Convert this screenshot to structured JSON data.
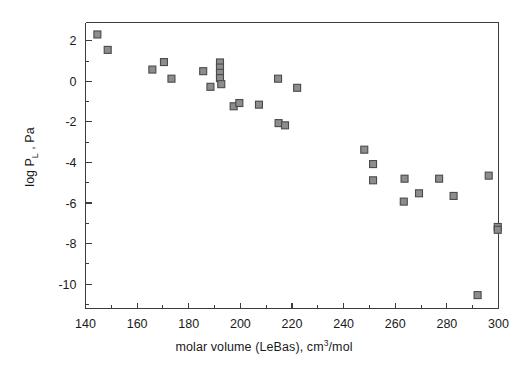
{
  "chart_data": {
    "type": "scatter",
    "title": "",
    "xlabel": "molar volume (LeBas), cm3/mol",
    "xlabel_parts": {
      "pre": "molar volume (LeBas), cm",
      "sup": "3",
      "post": "/mol"
    },
    "ylabel": "log PL , Pa",
    "ylabel_parts": {
      "pre": "log P",
      "sub": "L",
      "post": " , Pa"
    },
    "xlim": [
      140,
      300
    ],
    "ylim": [
      -11.2,
      2.9
    ],
    "xticks": [
      140,
      160,
      180,
      200,
      220,
      240,
      260,
      280,
      300
    ],
    "xticklabels": [
      "140",
      "160",
      "180",
      "200",
      "220",
      "240",
      "260",
      "280",
      "300"
    ],
    "xminor_step": 10,
    "yticks": [
      2,
      0,
      -2,
      -4,
      -6,
      -8,
      -10
    ],
    "yticklabels": [
      "2",
      "0",
      "-2",
      "-4",
      "-6",
      "-8",
      "-10"
    ],
    "yminor_step": 1,
    "grid": false,
    "legend": false,
    "marker_style": "filled-square-outlined",
    "marker_fill": "#8d8d8d",
    "marker_edge": "#4a4a4a",
    "marker_size_px": 7,
    "points": [
      {
        "x": 144.6,
        "y": 2.31
      },
      {
        "x": 148.6,
        "y": 1.55
      },
      {
        "x": 165.9,
        "y": 0.58
      },
      {
        "x": 170.4,
        "y": 0.95
      },
      {
        "x": 173.3,
        "y": 0.13
      },
      {
        "x": 185.6,
        "y": 0.5
      },
      {
        "x": 188.4,
        "y": -0.27
      },
      {
        "x": 192.1,
        "y": 0.93
      },
      {
        "x": 192.1,
        "y": 0.68
      },
      {
        "x": 192.1,
        "y": 0.42
      },
      {
        "x": 192.1,
        "y": 0.16
      },
      {
        "x": 192.6,
        "y": -0.14
      },
      {
        "x": 197.4,
        "y": -1.23
      },
      {
        "x": 199.6,
        "y": -1.07
      },
      {
        "x": 207.2,
        "y": -1.15
      },
      {
        "x": 214.6,
        "y": 0.13
      },
      {
        "x": 214.8,
        "y": -2.06
      },
      {
        "x": 217.3,
        "y": -2.17
      },
      {
        "x": 222.0,
        "y": -0.32
      },
      {
        "x": 248.0,
        "y": -3.37
      },
      {
        "x": 251.4,
        "y": -4.08
      },
      {
        "x": 251.4,
        "y": -4.88
      },
      {
        "x": 263.3,
        "y": -5.93
      },
      {
        "x": 263.6,
        "y": -4.8
      },
      {
        "x": 269.2,
        "y": -5.52
      },
      {
        "x": 277.0,
        "y": -4.8
      },
      {
        "x": 282.6,
        "y": -5.65
      },
      {
        "x": 291.9,
        "y": -10.54
      },
      {
        "x": 296.2,
        "y": -4.65
      },
      {
        "x": 299.7,
        "y": -7.18
      },
      {
        "x": 299.7,
        "y": -7.32
      }
    ]
  },
  "colors": {
    "axis": "#3c3c3c",
    "text": "#1a1a1a",
    "marker_fill": "#8d8d8d",
    "marker_edge": "#4a4a4a",
    "background": "#ffffff"
  }
}
